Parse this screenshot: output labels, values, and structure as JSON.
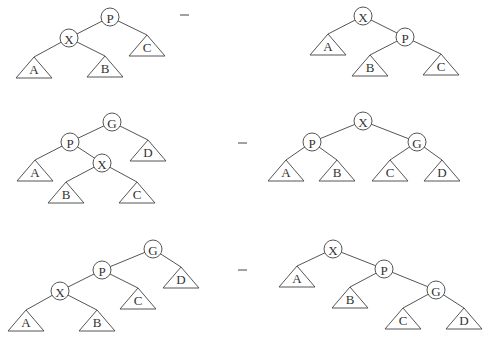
{
  "diagram": {
    "node_radius": 9,
    "triangle_half_width": 18,
    "triangle_height": 21,
    "arrow_glyph": "→",
    "arrows": [
      {
        "x": 180,
        "y": 15
      },
      {
        "x": 238,
        "y": 143
      },
      {
        "x": 238,
        "y": 270
      }
    ],
    "rows": [
      {
        "name": "zig",
        "before": {
          "nodes": [
            {
              "id": "P",
              "label": "P",
              "x": 110,
              "y": 17
            },
            {
              "id": "X",
              "label": "X",
              "x": 69,
              "y": 38
            }
          ],
          "subtrees": [
            {
              "label": "A",
              "x": 34,
              "y": 57
            },
            {
              "label": "B",
              "x": 105,
              "y": 56
            },
            {
              "label": "C",
              "x": 147,
              "y": 35
            }
          ],
          "edges": [
            [
              110,
              17,
              69,
              38
            ],
            [
              110,
              17,
              147,
              35
            ],
            [
              69,
              38,
              34,
              57
            ],
            [
              69,
              38,
              105,
              56
            ]
          ]
        },
        "after": {
          "nodes": [
            {
              "id": "X",
              "label": "X",
              "x": 363,
              "y": 16
            },
            {
              "id": "P",
              "label": "P",
              "x": 405,
              "y": 37
            }
          ],
          "subtrees": [
            {
              "label": "A",
              "x": 328,
              "y": 34
            },
            {
              "label": "B",
              "x": 370,
              "y": 55
            },
            {
              "label": "C",
              "x": 441,
              "y": 54
            }
          ],
          "edges": [
            [
              363,
              16,
              328,
              34
            ],
            [
              363,
              16,
              405,
              37
            ],
            [
              405,
              37,
              370,
              55
            ],
            [
              405,
              37,
              441,
              54
            ]
          ]
        }
      },
      {
        "name": "zig-zag",
        "before": {
          "nodes": [
            {
              "id": "G",
              "label": "G",
              "x": 112,
              "y": 122
            },
            {
              "id": "P",
              "label": "P",
              "x": 70,
              "y": 142
            },
            {
              "id": "X",
              "label": "X",
              "x": 102,
              "y": 163
            }
          ],
          "subtrees": [
            {
              "label": "A",
              "x": 35,
              "y": 160
            },
            {
              "label": "B",
              "x": 66,
              "y": 182
            },
            {
              "label": "C",
              "x": 137,
              "y": 182
            },
            {
              "label": "D",
              "x": 148,
              "y": 140
            }
          ],
          "edges": [
            [
              112,
              122,
              70,
              142
            ],
            [
              112,
              122,
              148,
              140
            ],
            [
              70,
              142,
              35,
              160
            ],
            [
              70,
              142,
              102,
              163
            ],
            [
              102,
              163,
              66,
              182
            ],
            [
              102,
              163,
              137,
              182
            ]
          ]
        },
        "after": {
          "nodes": [
            {
              "id": "X",
              "label": "X",
              "x": 363,
              "y": 121
            },
            {
              "id": "P",
              "label": "P",
              "x": 312,
              "y": 142
            },
            {
              "id": "G",
              "label": "G",
              "x": 417,
              "y": 142
            }
          ],
          "subtrees": [
            {
              "label": "A",
              "x": 286,
              "y": 160
            },
            {
              "label": "B",
              "x": 337,
              "y": 160
            },
            {
              "label": "C",
              "x": 390,
              "y": 160
            },
            {
              "label": "D",
              "x": 442,
              "y": 160
            }
          ],
          "edges": [
            [
              363,
              121,
              312,
              142
            ],
            [
              363,
              121,
              417,
              142
            ],
            [
              312,
              142,
              286,
              160
            ],
            [
              312,
              142,
              337,
              160
            ],
            [
              417,
              142,
              390,
              160
            ],
            [
              417,
              142,
              442,
              160
            ]
          ]
        }
      },
      {
        "name": "zig-zig",
        "before": {
          "nodes": [
            {
              "id": "G",
              "label": "G",
              "x": 153,
              "y": 249
            },
            {
              "id": "P",
              "label": "P",
              "x": 102,
              "y": 270
            },
            {
              "id": "X",
              "label": "X",
              "x": 60,
              "y": 291
            }
          ],
          "subtrees": [
            {
              "label": "A",
              "x": 26,
              "y": 310
            },
            {
              "label": "B",
              "x": 97,
              "y": 310
            },
            {
              "label": "C",
              "x": 138,
              "y": 288
            },
            {
              "label": "D",
              "x": 181,
              "y": 267
            }
          ],
          "edges": [
            [
              153,
              249,
              102,
              270
            ],
            [
              153,
              249,
              181,
              267
            ],
            [
              102,
              270,
              60,
              291
            ],
            [
              102,
              270,
              138,
              288
            ],
            [
              60,
              291,
              26,
              310
            ],
            [
              60,
              291,
              97,
              310
            ]
          ]
        },
        "after": {
          "nodes": [
            {
              "id": "X",
              "label": "X",
              "x": 333,
              "y": 249
            },
            {
              "id": "P",
              "label": "P",
              "x": 384,
              "y": 269
            },
            {
              "id": "G",
              "label": "G",
              "x": 436,
              "y": 290
            }
          ],
          "subtrees": [
            {
              "label": "A",
              "x": 297,
              "y": 266
            },
            {
              "label": "B",
              "x": 350,
              "y": 287
            },
            {
              "label": "C",
              "x": 403,
              "y": 308
            },
            {
              "label": "D",
              "x": 464,
              "y": 308
            }
          ],
          "edges": [
            [
              333,
              249,
              297,
              266
            ],
            [
              333,
              249,
              384,
              269
            ],
            [
              384,
              269,
              350,
              287
            ],
            [
              384,
              269,
              436,
              290
            ],
            [
              436,
              290,
              403,
              308
            ],
            [
              436,
              290,
              464,
              308
            ]
          ]
        }
      }
    ]
  }
}
